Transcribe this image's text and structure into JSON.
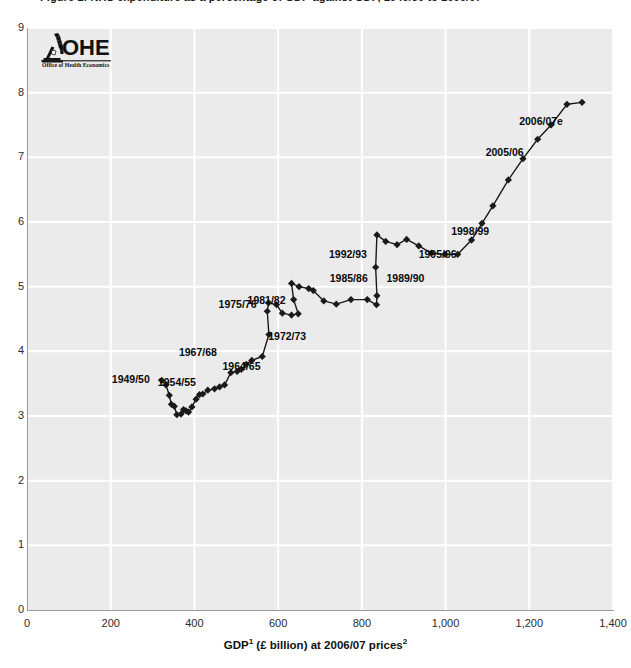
{
  "title_clipped": "Figure 1: NHS expenditure as a percentage of GDP against GDP, 1949/50 to 2006/07",
  "logo": {
    "mark_name": "ohe-microscope-mark",
    "wordmark": "OHE",
    "strapline": "Office of Health Economics"
  },
  "chart_data": {
    "type": "scatter",
    "title": "",
    "xlabel_parts": {
      "pre": "GDP",
      "sup1": "1",
      "mid": " (£ billion) at 2006/07 prices",
      "sup2": "2"
    },
    "xlabel": "GDP1 (£ billion) at 2006/07 prices2",
    "ylabel": "",
    "xlim": [
      0,
      1400
    ],
    "ylim": [
      0,
      9
    ],
    "xticks": [
      0,
      200,
      400,
      600,
      800,
      1000,
      1200,
      1400
    ],
    "xticklabels": [
      "0",
      "200",
      "400",
      "600",
      "800",
      "1,000",
      "1,200",
      "1,400"
    ],
    "yticks": [
      0,
      1,
      2,
      3,
      4,
      5,
      6,
      7,
      8,
      9
    ],
    "yticklabels": [
      "0",
      "1",
      "2",
      "3",
      "4",
      "5",
      "6",
      "7",
      "8",
      "9"
    ],
    "grid": true,
    "grid_color": "#ffffff",
    "plot_background": "#ebebeb",
    "marker": "diamond",
    "marker_color": "#1a1a1a",
    "line_color": "#1a1a1a",
    "legend": "none",
    "series": [
      {
        "name": "NHS expenditure as % of GDP vs GDP",
        "points": [
          {
            "year": "1949/50",
            "x": 322,
            "y": 3.55
          },
          {
            "year": "1950/51",
            "x": 332,
            "y": 3.48
          },
          {
            "year": "1951/52",
            "x": 340,
            "y": 3.32
          },
          {
            "year": "1952/53",
            "x": 345,
            "y": 3.18
          },
          {
            "year": "1953/54",
            "x": 352,
            "y": 3.15
          },
          {
            "year": "1954/55",
            "x": 358,
            "y": 3.02
          },
          {
            "year": "1955/56",
            "x": 368,
            "y": 3.03
          },
          {
            "year": "1956/57",
            "x": 374,
            "y": 3.1
          },
          {
            "year": "1957/58",
            "x": 380,
            "y": 3.08
          },
          {
            "year": "1958/59",
            "x": 386,
            "y": 3.06
          },
          {
            "year": "1959/60",
            "x": 394,
            "y": 3.14
          },
          {
            "year": "1960/61",
            "x": 404,
            "y": 3.26
          },
          {
            "year": "1961/62",
            "x": 412,
            "y": 3.33
          },
          {
            "year": "1962/63",
            "x": 420,
            "y": 3.34
          },
          {
            "year": "1963/64",
            "x": 432,
            "y": 3.4
          },
          {
            "year": "1964/65",
            "x": 448,
            "y": 3.42
          },
          {
            "year": "1965/66",
            "x": 460,
            "y": 3.45
          },
          {
            "year": "1966/67",
            "x": 472,
            "y": 3.48
          },
          {
            "year": "1967/68",
            "x": 487,
            "y": 3.67
          },
          {
            "year": "1968/69",
            "x": 502,
            "y": 3.69
          },
          {
            "year": "1969/70",
            "x": 512,
            "y": 3.72
          },
          {
            "year": "1970/71",
            "x": 524,
            "y": 3.8
          },
          {
            "year": "1971/72",
            "x": 537,
            "y": 3.86
          },
          {
            "year": "1972/73",
            "x": 562,
            "y": 3.92
          },
          {
            "year": "1973/74",
            "x": 578,
            "y": 4.26
          },
          {
            "year": "1974/75",
            "x": 574,
            "y": 4.62
          },
          {
            "year": "1975/76",
            "x": 577,
            "y": 4.75
          },
          {
            "year": "1976/77",
            "x": 596,
            "y": 4.72
          },
          {
            "year": "1977/78",
            "x": 610,
            "y": 4.59
          },
          {
            "year": "1978/79",
            "x": 632,
            "y": 4.56
          },
          {
            "year": "1979/80",
            "x": 648,
            "y": 4.58
          },
          {
            "year": "1980/81",
            "x": 637,
            "y": 4.8
          },
          {
            "year": "1981/82",
            "x": 632,
            "y": 5.05
          },
          {
            "year": "1982/83",
            "x": 650,
            "y": 5.0
          },
          {
            "year": "1983/84",
            "x": 673,
            "y": 4.97
          },
          {
            "year": "1984/85",
            "x": 684,
            "y": 4.94
          },
          {
            "year": "1985/86",
            "x": 709,
            "y": 4.78
          },
          {
            "year": "1986/87",
            "x": 739,
            "y": 4.73
          },
          {
            "year": "1987/88",
            "x": 774,
            "y": 4.8
          },
          {
            "year": "1988/89",
            "x": 813,
            "y": 4.8
          },
          {
            "year": "1989/90",
            "x": 835,
            "y": 4.72
          },
          {
            "year": "1990/91",
            "x": 836,
            "y": 4.86
          },
          {
            "year": "1991/92",
            "x": 833,
            "y": 5.3
          },
          {
            "year": "1992/93",
            "x": 836,
            "y": 5.8
          },
          {
            "year": "1993/94",
            "x": 857,
            "y": 5.7
          },
          {
            "year": "1994/95",
            "x": 884,
            "y": 5.65
          },
          {
            "year": "1995/96",
            "x": 907,
            "y": 5.73
          },
          {
            "year": "1996/97",
            "x": 936,
            "y": 5.63
          },
          {
            "year": "1997/98",
            "x": 966,
            "y": 5.52
          },
          {
            "year": "1998/99",
            "x": 999,
            "y": 5.5
          },
          {
            "year": "1999/00",
            "x": 1029,
            "y": 5.5
          },
          {
            "year": "2000/01",
            "x": 1062,
            "y": 5.72
          },
          {
            "year": "2001/02",
            "x": 1087,
            "y": 5.98
          },
          {
            "year": "2002/03",
            "x": 1113,
            "y": 6.25
          },
          {
            "year": "2003/04",
            "x": 1150,
            "y": 6.65
          },
          {
            "year": "2004/05",
            "x": 1185,
            "y": 6.98
          },
          {
            "year": "2005/06",
            "x": 1220,
            "y": 7.28
          },
          {
            "year": "2006/07e",
            "x": 1252,
            "y": 7.5
          },
          {
            "year": "2006/07e-final",
            "x": 1290,
            "y": 7.82
          },
          {
            "year": "2006/07e-tip",
            "x": 1326,
            "y": 7.85
          }
        ]
      }
    ],
    "annotations": [
      {
        "text": "1949/50",
        "x": 322,
        "y": 3.55,
        "dx": -12,
        "dy": 0,
        "anchor": "end"
      },
      {
        "text": "1954/55",
        "x": 358,
        "y": 3.02,
        "dx": 0,
        "dy": -32,
        "anchor": "mid"
      },
      {
        "text": "1964/65",
        "x": 448,
        "y": 3.42,
        "dx": 8,
        "dy": -22,
        "anchor": "start"
      },
      {
        "text": "1967/68",
        "x": 487,
        "y": 3.67,
        "dx": -14,
        "dy": -20,
        "anchor": "end"
      },
      {
        "text": "1972/73",
        "x": 562,
        "y": 3.92,
        "dx": 6,
        "dy": -20,
        "anchor": "start"
      },
      {
        "text": "1975/76",
        "x": 577,
        "y": 4.75,
        "dx": -12,
        "dy": 2,
        "anchor": "end"
      },
      {
        "text": "1981/82",
        "x": 632,
        "y": 5.05,
        "dx": -6,
        "dy": 18,
        "anchor": "end"
      },
      {
        "text": "1985/86",
        "x": 709,
        "y": 4.78,
        "dx": 6,
        "dy": -22,
        "anchor": "start"
      },
      {
        "text": "1989/90",
        "x": 835,
        "y": 4.72,
        "dx": 10,
        "dy": -26,
        "anchor": "start"
      },
      {
        "text": "1992/93",
        "x": 836,
        "y": 5.8,
        "dx": -10,
        "dy": 20,
        "anchor": "end"
      },
      {
        "text": "1995/96",
        "x": 907,
        "y": 5.73,
        "dx": 12,
        "dy": 16,
        "anchor": "start"
      },
      {
        "text": "1998/99",
        "x": 999,
        "y": 5.5,
        "dx": 6,
        "dy": -22,
        "anchor": "start"
      },
      {
        "text": "2005/06",
        "x": 1220,
        "y": 7.28,
        "dx": -14,
        "dy": 14,
        "anchor": "end"
      },
      {
        "text": "2006/07e",
        "x": 1290,
        "y": 7.82,
        "dx": -4,
        "dy": 18,
        "anchor": "end"
      }
    ]
  }
}
